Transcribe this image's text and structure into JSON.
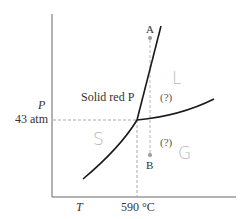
{
  "diagram": {
    "type": "phase-diagram",
    "substance": "phosphorus",
    "axes": {
      "y_label": "P",
      "x_label": "T",
      "y_tick": "43 atm",
      "x_tick": "590 °C"
    },
    "regions": {
      "solid_label": "Solid red P",
      "unknown_upper": "(?)",
      "unknown_lower": "(?)"
    },
    "points": {
      "a_label": "A",
      "b_label": "B"
    },
    "handwritten": {
      "liquid": "L",
      "solid": "S",
      "gas": "G"
    },
    "colors": {
      "curve": "#1a1a1a",
      "axis": "#555555",
      "dashed": "#aaaaaa",
      "point": "#999999",
      "handwriting": "#b8b8b8"
    },
    "triple_point": {
      "pressure": "43 atm",
      "temperature": "590 °C"
    }
  }
}
